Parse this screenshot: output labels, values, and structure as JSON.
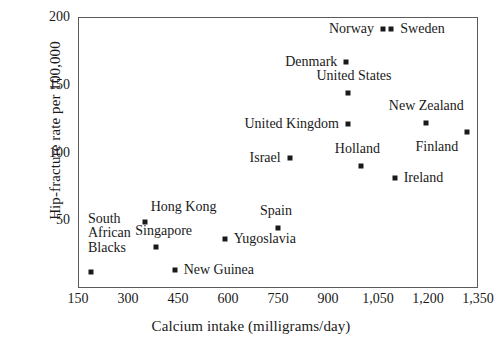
{
  "chart_data": {
    "type": "scatter",
    "title": "",
    "xlabel": "Calcium intake (milligrams/day)",
    "ylabel": "Hip-fracture rate per 100,000",
    "xlim": [
      150,
      1350
    ],
    "ylim": [
      0,
      200
    ],
    "grid": false,
    "legend": "none",
    "xticks": [
      "150",
      "300",
      "450",
      "600",
      "750",
      "900",
      "1,050",
      "1,200",
      "1,350"
    ],
    "xtick_values": [
      150,
      300,
      450,
      600,
      750,
      900,
      1050,
      1200,
      1350
    ],
    "yticks": [
      "50",
      "100",
      "150",
      "200"
    ],
    "ytick_values": [
      50,
      100,
      150,
      200
    ],
    "points": [
      {
        "label": "Norway",
        "x": 1065,
        "y": 191,
        "label_pos": "end",
        "label_dx": -9,
        "label_dy": 0
      },
      {
        "label": "Sweden",
        "x": 1090,
        "y": 191,
        "label_pos": "start",
        "label_dx": 9,
        "label_dy": 0
      },
      {
        "label": "Denmark",
        "x": 955,
        "y": 167,
        "label_pos": "end",
        "label_dx": -9,
        "label_dy": 0
      },
      {
        "label": "United States",
        "x": 960,
        "y": 144,
        "label_pos": "mid",
        "label_dx": 6,
        "label_dy": -17
      },
      {
        "label": "New Zealand",
        "x": 1195,
        "y": 122,
        "label_pos": "mid",
        "label_dx": 0,
        "label_dy": -17
      },
      {
        "label": "United Kingdom",
        "x": 960,
        "y": 121,
        "label_pos": "end",
        "label_dx": -9,
        "label_dy": 0
      },
      {
        "label": "Finland",
        "x": 1318,
        "y": 115,
        "label_pos": "end",
        "label_dx": -9,
        "label_dy": 15
      },
      {
        "label": "Israel",
        "x": 785,
        "y": 96,
        "label_pos": "end",
        "label_dx": -9,
        "label_dy": 0
      },
      {
        "label": "Holland",
        "x": 1000,
        "y": 90,
        "label_pos": "mid",
        "label_dx": -4,
        "label_dy": -17
      },
      {
        "label": "Ireland",
        "x": 1100,
        "y": 81,
        "label_pos": "start",
        "label_dx": 9,
        "label_dy": 0
      },
      {
        "label": "Hong Kong",
        "x": 350,
        "y": 49,
        "label_pos": "start",
        "label_dx": 6,
        "label_dy": -15
      },
      {
        "label": "Spain",
        "x": 750,
        "y": 44,
        "label_pos": "mid",
        "label_dx": -2,
        "label_dy": -17
      },
      {
        "label": "Singapore",
        "x": 383,
        "y": 30,
        "label_pos": "mid",
        "label_dx": 8,
        "label_dy": -16
      },
      {
        "label": "Yugoslavia",
        "x": 590,
        "y": 36,
        "label_pos": "start",
        "label_dx": 9,
        "label_dy": 0
      },
      {
        "label": "New Guinea",
        "x": 440,
        "y": 13,
        "label_pos": "start",
        "label_dx": 9,
        "label_dy": 0
      },
      {
        "label": "South\nAfrican\nBlacks",
        "x": 190,
        "y": 12,
        "label_pos": "mid",
        "label_dx": 18,
        "label_dy": -38
      }
    ]
  }
}
